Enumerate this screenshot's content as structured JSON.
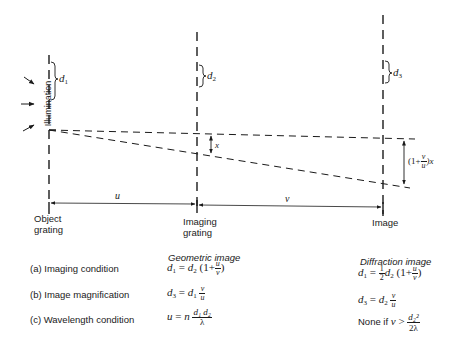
{
  "diagram": {
    "planes": [
      {
        "id": "object",
        "label_lines": [
          "Object",
          "grating"
        ]
      },
      {
        "id": "imaging",
        "label_lines": [
          "Imaging",
          "grating"
        ]
      },
      {
        "id": "image",
        "label_lines": [
          "Image"
        ]
      }
    ],
    "illumination_label": "Illumination",
    "period_labels": {
      "d1": "d",
      "d1_sub": "1",
      "d2": "d",
      "d2_sub": "2",
      "d3": "d",
      "d3_sub": "3"
    },
    "distance_labels": {
      "u": "u",
      "v": "v"
    },
    "offset_labels": {
      "x": "x",
      "image_offset_prefix": "(1+",
      "image_offset_num": "v",
      "image_offset_den": "u",
      "image_offset_suffix": ")x"
    }
  },
  "table": {
    "headers": {
      "geometric": "Geometric image",
      "diffraction": "Diffraction image"
    },
    "rows": [
      {
        "label": "(a) Imaging condition",
        "geometric": {
          "lhs": "d",
          "lhs_sub": "1",
          "eq": " = ",
          "d": "d",
          "d_sub": "2",
          "open": " (1+",
          "num": "u",
          "den": "v",
          "close": ")"
        },
        "diffraction": {
          "lhs": "d",
          "lhs_sub": "1",
          "eq": " = ",
          "coef_num": "1",
          "coef_den": "2",
          "d": "d",
          "d_sub": "2",
          "open": " (1+",
          "num": "u",
          "den": "v",
          "close": ")"
        }
      },
      {
        "label": "(b) Image magnification",
        "geometric": {
          "lhs": "d",
          "lhs_sub": "3",
          "eq": " = ",
          "d": "d",
          "d_sub": "1",
          "num": "v",
          "den": "u"
        },
        "diffraction": {
          "lhs": "d",
          "lhs_sub": "3",
          "eq": " = ",
          "d": "d",
          "d_sub": "2",
          "num": "v",
          "den": "u"
        }
      },
      {
        "label": "(c) Wavelength condition",
        "geometric": {
          "lhs": "u",
          "eq": " = ",
          "n": "n",
          "num": "d₁ d₂",
          "den": "λ"
        },
        "diffraction": {
          "prefix": "None if ",
          "var": "v",
          "op": " > ",
          "num": "d₂²",
          "den": "2λ"
        }
      }
    ]
  }
}
